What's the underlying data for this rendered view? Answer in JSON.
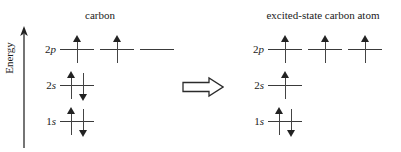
{
  "figure": {
    "energy_axis_label": "Energy",
    "transition_symbol": "double-right-arrow"
  },
  "left": {
    "title": "carbon",
    "shells": [
      {
        "label_prefix": "2",
        "label_suffix": "p",
        "label": "2p",
        "orbitals": [
          {
            "electrons": [
              "up"
            ]
          },
          {
            "electrons": [
              "up"
            ]
          },
          {
            "electrons": []
          }
        ]
      },
      {
        "label_prefix": "2",
        "label_suffix": "s",
        "label": "2s",
        "orbitals": [
          {
            "electrons": [
              "up",
              "down"
            ]
          }
        ]
      },
      {
        "label_prefix": "1",
        "label_suffix": "s",
        "label": "1s",
        "orbitals": [
          {
            "electrons": [
              "up",
              "down"
            ]
          }
        ]
      }
    ]
  },
  "right": {
    "title": "excited-state carbon atom",
    "shells": [
      {
        "label_prefix": "2",
        "label_suffix": "p",
        "label": "2p",
        "orbitals": [
          {
            "electrons": [
              "up"
            ]
          },
          {
            "electrons": [
              "up"
            ]
          },
          {
            "electrons": [
              "up"
            ]
          }
        ]
      },
      {
        "label_prefix": "2",
        "label_suffix": "s",
        "label": "2s",
        "orbitals": [
          {
            "electrons": [
              "up"
            ]
          }
        ]
      },
      {
        "label_prefix": "1",
        "label_suffix": "s",
        "label": "1s",
        "orbitals": [
          {
            "electrons": [
              "up",
              "down"
            ]
          }
        ]
      }
    ]
  },
  "geometry": {
    "row_tops": [
      35,
      71,
      107
    ],
    "orbital_pitch": 40,
    "colors": {
      "line": "#3a3a3a",
      "arrow": "#222222",
      "text": "#1a1a1a",
      "background": "#ffffff"
    }
  }
}
